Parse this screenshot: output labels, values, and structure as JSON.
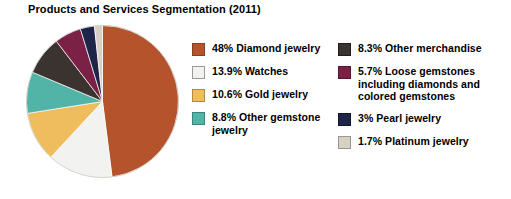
{
  "chart_data": {
    "type": "pie",
    "title": "Products and Services Segmentation (2011)",
    "xlabel": "",
    "ylabel": "",
    "legend_position": "right",
    "grid": false,
    "start_angle_deg": 0,
    "direction": "clockwise",
    "categories": [
      "Diamond jewelry",
      "Watches",
      "Gold jewelry",
      "Other gemstone jewelry",
      "Other merchandise",
      "Loose gemstones including diamonds and colored gemstones",
      "Pearl jewelry",
      "Platinum jewelry"
    ],
    "values": [
      48,
      13.9,
      10.6,
      8.8,
      8.3,
      5.7,
      3,
      1.7
    ],
    "colors": [
      "#B5532C",
      "#F2F2F0",
      "#EFBC5E",
      "#52B4A6",
      "#3A3330",
      "#7A2145",
      "#1E2549",
      "#D6D1C4"
    ],
    "slices": [
      {
        "label": "Diamond jewelry",
        "value": 48,
        "color": "#B5532C"
      },
      {
        "label": "Watches",
        "value": 13.9,
        "color": "#F2F2F0"
      },
      {
        "label": "Gold jewelry",
        "value": 10.6,
        "color": "#EFBC5E"
      },
      {
        "label": "Other gemstone jewelry",
        "value": 8.8,
        "color": "#52B4A6"
      },
      {
        "label": "Other merchandise",
        "value": 8.3,
        "color": "#3A3330"
      },
      {
        "label": "Loose gemstones including diamonds and colored gemstones",
        "value": 5.7,
        "color": "#7A2145"
      },
      {
        "label": "Pearl jewelry",
        "value": 3,
        "color": "#1E2549"
      },
      {
        "label": "Platinum jewelry",
        "value": 1.7,
        "color": "#D6D1C4"
      }
    ]
  },
  "legend": {
    "left_column": [
      {
        "text": "48% Diamond jewelry",
        "color": "#B5532C",
        "border": "#8A3E20"
      },
      {
        "text": "13.9% Watches",
        "color": "#F2F2F0",
        "border": "#9A9A98"
      },
      {
        "text": "10.6% Gold jewelry",
        "color": "#EFBC5E",
        "border": "#B08C3C"
      },
      {
        "text": "8.8% Other gemstone jewelry",
        "color": "#52B4A6",
        "border": "#38867B"
      }
    ],
    "right_column": [
      {
        "text": "8.3% Other merchandise",
        "color": "#3A3330",
        "border": "#221E1C"
      },
      {
        "text": "5.7% Loose gemstones including diamonds and colored gemstones",
        "color": "#7A2145",
        "border": "#561630"
      },
      {
        "text": "3% Pearl jewelry",
        "color": "#1E2549",
        "border": "#121730"
      },
      {
        "text": "1.7% Platinum jewelry",
        "color": "#D6D1C4",
        "border": "#9A968A"
      }
    ]
  }
}
